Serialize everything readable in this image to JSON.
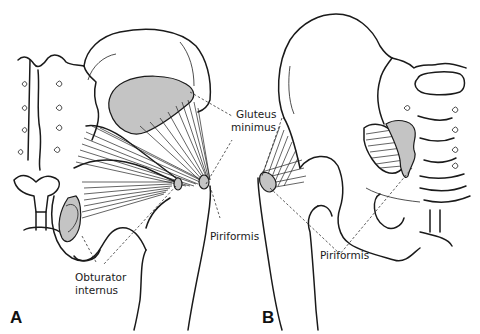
{
  "figure": {
    "panels": [
      {
        "id": "A",
        "label": "A",
        "view": "posterior hip, left side"
      },
      {
        "id": "B",
        "label": "B",
        "view": "posterior hip, right side"
      }
    ],
    "labels": {
      "gluteus_minimus_1": "Gluteus",
      "gluteus_minimus_2": "minimus",
      "piriformis_a": "Piriformis",
      "piriformis_b": "Piriformis",
      "obturator_internus_1": "Obturator",
      "obturator_internus_2": "internus"
    },
    "colors": {
      "muscle_shade": "#c4c4c4",
      "outline": "#1a1a1a",
      "background": "#ffffff"
    }
  }
}
